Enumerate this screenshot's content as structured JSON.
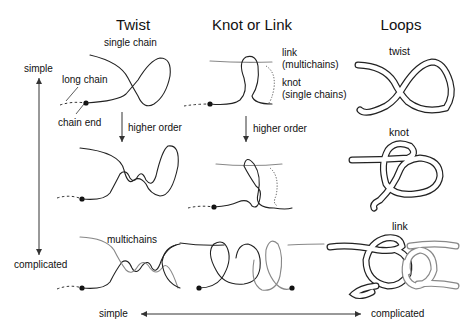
{
  "columns": [
    {
      "id": "twist",
      "title": "Twist"
    },
    {
      "id": "knot-or-link",
      "title": "Knot or Link"
    },
    {
      "id": "loops",
      "title": "Loops"
    }
  ],
  "twist": {
    "top_label": "single chain",
    "long_chain_label": "long chain",
    "chain_end_label": "chain end",
    "arrow_label": "higher order",
    "bottom_label": "multichains"
  },
  "knot_or_link": {
    "link_label_1": "link",
    "link_label_2": "(multichains)",
    "knot_label_1": "knot",
    "knot_label_2": "(single chains)",
    "arrow_label": "higher order"
  },
  "loops": {
    "row1_label": "twist",
    "row2_label": "knot",
    "row3_label": "link"
  },
  "vertical_axis": {
    "top": "simple",
    "bottom": "complicated"
  },
  "horizontal_axis": {
    "left": "simple",
    "right": "complicated"
  }
}
